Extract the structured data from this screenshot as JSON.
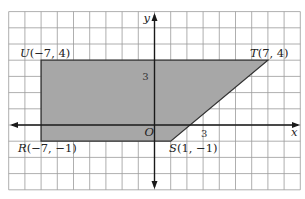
{
  "chart_data": {
    "type": "polygon-plot",
    "title": "",
    "xlabel": "x",
    "ylabel": "y",
    "origin_label": "O",
    "xlim": [
      -9,
      9
    ],
    "ylim": [
      -4,
      7
    ],
    "grid": true,
    "tick_labels": {
      "x": [
        "3"
      ],
      "y": [
        "3"
      ]
    },
    "polygon": {
      "fill": "#a7a7a7",
      "stroke": "#333333",
      "vertices": [
        {
          "name": "U",
          "x": -7,
          "y": 4,
          "label": "U(−7, 4)"
        },
        {
          "name": "T",
          "x": 7,
          "y": 4,
          "label": "T(7, 4)"
        },
        {
          "name": "S",
          "x": 1,
          "y": -1,
          "label": "S(1, −1)"
        },
        {
          "name": "R",
          "x": -7,
          "y": -1,
          "label": "R(−7, −1)"
        }
      ]
    }
  },
  "colors": {
    "grid": "#9a9a9a",
    "axis": "#1a1a1a",
    "fill": "#a7a7a7"
  }
}
